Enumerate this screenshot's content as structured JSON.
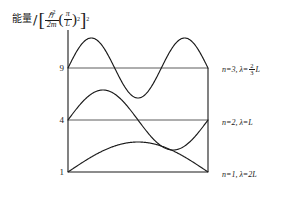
{
  "axis": {
    "ylabel_prefix": "能量",
    "ylabel_slash": "/",
    "ylabel_num": "ℏ",
    "ylabel_num_sup": "2",
    "ylabel_den": "2m",
    "ylabel_paren_num": "π",
    "ylabel_paren_den": "L",
    "ylabel_paren_sup": "2",
    "bracket_open": "[",
    "bracket_close": "]"
  },
  "levels": [
    {
      "n": 3,
      "tick": "9",
      "energy": 9,
      "label_n": "n=3,",
      "label_lambda": "λ=",
      "label_frac_num": "2",
      "label_frac_den": "3",
      "label_tail": "L",
      "wavelength": "2/3 L"
    },
    {
      "n": 2,
      "tick": "4",
      "energy": 4,
      "label_n": "n=2,",
      "label_lambda": "λ=",
      "label_frac_num": "",
      "label_frac_den": "",
      "label_tail": "L",
      "wavelength": "L"
    },
    {
      "n": 1,
      "tick": "1",
      "energy": 1,
      "label_n": "n=1,",
      "label_lambda": "λ=",
      "label_frac_num": "",
      "label_frac_den": "",
      "label_tail": "2L",
      "wavelength": "2L"
    }
  ],
  "colors": {
    "ink": "#1a1a1a",
    "curve": "#1a1a1a",
    "baseline": "#4a4a4a"
  },
  "chart_data": {
    "type": "line",
    "xlabel": "",
    "ylabel": "能量/[ℏ²/2m (π/L)²]",
    "ytick_labels": [
      "9",
      "4",
      "1"
    ],
    "ytick_values": [
      9,
      4,
      1
    ],
    "ylim": [
      0,
      11
    ],
    "xlim": [
      0,
      1
    ],
    "grid": false,
    "legend": "right-of-axes",
    "series": [
      {
        "name": "n=1, λ=2L",
        "quantum_number": 1,
        "energy_level": 1,
        "wavelength": "2L",
        "nodes": 2,
        "half_wavelengths": 1,
        "baseline_y": 1,
        "amplitude": 1.55,
        "formula": "y = 1 + A·sin(1·π·x/L)"
      },
      {
        "name": "n=2, λ=L",
        "quantum_number": 2,
        "energy_level": 4,
        "wavelength": "L",
        "nodes": 3,
        "half_wavelengths": 2,
        "baseline_y": 4,
        "amplitude": 1.55,
        "formula": "y = 4 + A·sin(2·π·x/L)"
      },
      {
        "name": "n=3, λ=2/3 L",
        "quantum_number": 3,
        "energy_level": 9,
        "wavelength": "2/3 L",
        "nodes": 4,
        "half_wavelengths": 3,
        "baseline_y": 9,
        "amplitude": 1.55,
        "formula": "y = 9 + A·sin(3·π·x/L)"
      }
    ],
    "box": {
      "left_wall": true,
      "right_wall": true,
      "bottom": true,
      "top": false,
      "description": "Infinite square well of width L"
    }
  }
}
